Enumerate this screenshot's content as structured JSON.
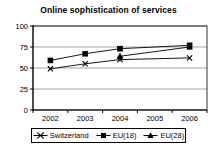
{
  "chart_data": {
    "type": "line",
    "title": "Online sophistication of services",
    "xlabel": "",
    "ylabel": "",
    "categories": [
      "2002",
      "2003",
      "2004",
      "2005",
      "2006"
    ],
    "x": [
      2002,
      2003,
      2004,
      2005,
      2006
    ],
    "xlim": [
      2001.5,
      2006.5
    ],
    "ylim": [
      0,
      100
    ],
    "yticks": [
      0,
      25,
      50,
      75,
      100
    ],
    "ytick_labels": [
      "0",
      "25",
      "50",
      "75",
      "100"
    ],
    "xtick_labels": [
      "2002",
      "2003",
      "2004",
      "2005",
      "2006"
    ],
    "grid": true,
    "grid_axis": "y",
    "legend_position": "bottom",
    "series": [
      {
        "name": "Switzerland",
        "marker": "plus",
        "color": "#000000",
        "x": [
          2002,
          2003,
          2004,
          2006
        ],
        "values": [
          49,
          55,
          60,
          62
        ]
      },
      {
        "name": "EU(18)",
        "marker": "square",
        "color": "#000000",
        "x": [
          2002,
          2003,
          2004,
          2006
        ],
        "values": [
          59,
          67,
          73,
          77
        ]
      },
      {
        "name": "EU(28)",
        "marker": "triangle",
        "color": "#000000",
        "x": [
          2004,
          2006
        ],
        "values": [
          64,
          75
        ]
      }
    ]
  },
  "legend": {
    "entries": [
      {
        "label": "Switzerland"
      },
      {
        "label": "EU(18)"
      },
      {
        "label": "EU(28)"
      }
    ]
  }
}
